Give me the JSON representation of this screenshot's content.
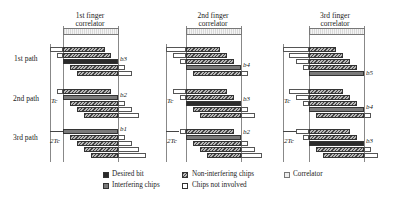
{
  "headers": [
    {
      "line1": "1st finger",
      "line2": "correlator"
    },
    {
      "line1": "2nd finger",
      "line2": "correlator"
    },
    {
      "line1": "3rd finger",
      "line2": "correlator"
    }
  ],
  "paths": [
    "1st path",
    "2nd path",
    "3rd path"
  ],
  "delay_labels": [
    "T_c",
    "2T_c"
  ],
  "delay_display": {
    "tc": "Tc",
    "two_tc": "2Tc"
  },
  "bit_labels": {
    "p1": [
      "b3",
      "b2",
      "b1"
    ],
    "p2": [
      "b4",
      "b3",
      "b2"
    ],
    "p3": [
      "b5",
      "b4",
      "b3"
    ]
  },
  "legend": [
    {
      "label": "Desired bit",
      "swatch": "#2a2a2a"
    },
    {
      "label": "Non-interfering chips",
      "swatch": "hatched"
    },
    {
      "label": "Correlator",
      "swatch": "dotted-light"
    },
    {
      "label": "Interfering chips",
      "swatch": "#7a7a7a"
    },
    {
      "label": "Chips not involved",
      "swatch": "#ffffff"
    }
  ],
  "colors": {
    "desired": "#2a2a2a",
    "interfering": "#7a7a7a",
    "not_involved": "#ffffff"
  }
}
